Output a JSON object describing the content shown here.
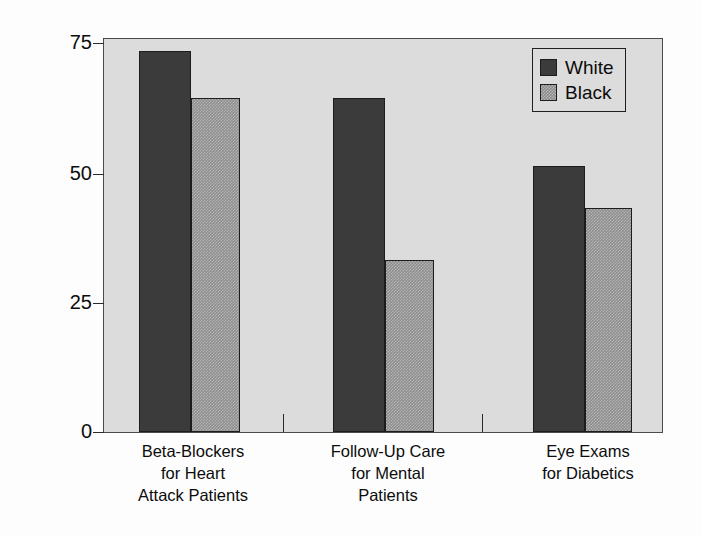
{
  "chart_data": {
    "type": "bar",
    "title": "",
    "subtitle": "",
    "xlabel": "",
    "ylabel": "Percentage Receiving Treatment",
    "ylim": [
      0,
      75
    ],
    "yticks": [
      0,
      25,
      50,
      75
    ],
    "ytick_labels": [
      "0",
      "25",
      "50",
      "75"
    ],
    "grid": false,
    "legend_position": "top-right",
    "categories": [
      "Beta-Blockers for Heart Attack Patients",
      "Follow-Up Care for Mental Patients",
      "Eye Exams for Diabetics"
    ],
    "category_lines": [
      [
        "Beta-Blockers",
        "for Heart",
        "Attack Patients"
      ],
      [
        "Follow-Up Care",
        "for Mental",
        "Patients"
      ],
      [
        "Eye Exams",
        "for Diabetics"
      ]
    ],
    "series": [
      {
        "name": "White",
        "values": [
          73,
          64,
          51
        ],
        "color": "#3b3b3b"
      },
      {
        "name": "Black",
        "values": [
          64,
          33,
          43
        ],
        "color": "#8e8e8e"
      }
    ]
  },
  "axes": {
    "y_title": "Percentage Receiving Treatment",
    "y_ticks": [
      {
        "label": "75",
        "value": 75
      },
      {
        "label": "50",
        "value": 50
      },
      {
        "label": "25",
        "value": 25
      },
      {
        "label": "0",
        "value": 0
      }
    ]
  },
  "legend": {
    "entries": [
      {
        "label": "White",
        "swatch": "series-white"
      },
      {
        "label": "Black",
        "swatch": "series-black"
      }
    ]
  },
  "colors": {
    "plot_background": "#dcdcdc",
    "page_background": "#fdfdfd",
    "frame": "#4a4a4a",
    "series_white": "#3b3b3b",
    "series_black": "#8e8e8e",
    "text": "#0c0c0c"
  }
}
